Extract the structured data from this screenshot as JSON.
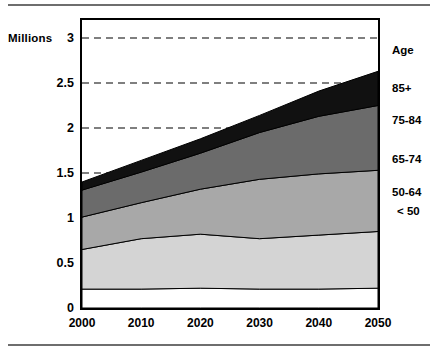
{
  "figure": {
    "axis_title": "Millions",
    "legend_header": "Age"
  },
  "chart_data": {
    "type": "area",
    "title": "Millions",
    "xlabel": "",
    "ylabel": "Millions",
    "stacked": true,
    "grid": "horizontal-dashed",
    "legend_position": "right",
    "legend_title": "Age",
    "x": [
      2000,
      2010,
      2020,
      2030,
      2040,
      2050
    ],
    "xtick_labels": [
      "2000",
      "2010",
      "2020",
      "2030",
      "2040",
      "2050"
    ],
    "xlim": [
      2000,
      2050
    ],
    "ylim": [
      0,
      3.2
    ],
    "ytick_labels": [
      "0",
      "0.5",
      "1",
      "1.5",
      "2",
      "2.5",
      "3"
    ],
    "ytick_values": [
      0,
      0.5,
      1,
      1.5,
      2,
      2.5,
      3
    ],
    "gridline_values": [
      1.5,
      2,
      2.5,
      3
    ],
    "series": [
      {
        "name": "< 50",
        "color": "#ffffff",
        "values": [
          0.21,
          0.21,
          0.22,
          0.21,
          0.21,
          0.22
        ]
      },
      {
        "name": "50-64",
        "color": "#d4d4d4",
        "values": [
          0.44,
          0.56,
          0.6,
          0.56,
          0.6,
          0.63
        ]
      },
      {
        "name": "65-74",
        "color": "#a8a8a8",
        "values": [
          0.36,
          0.4,
          0.5,
          0.66,
          0.68,
          0.68
        ]
      },
      {
        "name": "75-84",
        "color": "#6b6b6b",
        "values": [
          0.3,
          0.34,
          0.4,
          0.52,
          0.64,
          0.72
        ]
      },
      {
        "name": "85+",
        "color": "#111111",
        "values": [
          0.09,
          0.13,
          0.16,
          0.19,
          0.28,
          0.38
        ]
      }
    ],
    "totals": [
      1.4,
      1.64,
      1.88,
      2.14,
      2.41,
      2.63
    ],
    "legend_entries": [
      {
        "label": "85+",
        "y_value": 2.45
      },
      {
        "label": "75-84",
        "y_value": 2.09
      },
      {
        "label": "65-74",
        "y_value": 1.66
      },
      {
        "label": "50-64",
        "y_value": 1.29
      },
      {
        "label": "< 50",
        "y_value": 1.08
      }
    ]
  }
}
